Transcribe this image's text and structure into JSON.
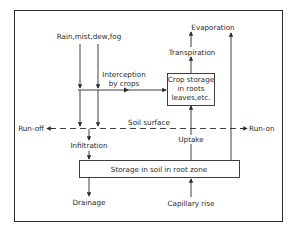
{
  "diagram": {
    "title": "",
    "labels": {
      "precipitation": "Rain,mist,dew,fog",
      "interception_line1": "Interception",
      "interception_line2": "by crops",
      "crop_storage_line1": "Crop storage",
      "crop_storage_line2": "in roots",
      "crop_storage_line3": "leaves,etc.",
      "transpiration": "Transpiration",
      "evaporation": "Evaporation",
      "soil_surface": "Soil surface",
      "run_off": "Run-off",
      "run_on": "Run-on",
      "infiltration": "Infiltration",
      "uptake": "Uptake",
      "soil_storage": "Storage in soil in root zone",
      "drainage": "Drainage",
      "capillary_rise": "Capillary rise"
    },
    "nodes": [
      {
        "id": "precipitation",
        "label": "Rain,mist,dew,fog",
        "type": "source"
      },
      {
        "id": "crop_storage",
        "label": "Crop storage in roots leaves,etc.",
        "type": "box"
      },
      {
        "id": "soil_storage",
        "label": "Storage in soil in root zone",
        "type": "box"
      },
      {
        "id": "transpiration",
        "label": "Transpiration",
        "type": "flow"
      },
      {
        "id": "evaporation",
        "label": "Evaporation",
        "type": "sink"
      },
      {
        "id": "run_off",
        "label": "Run-off",
        "type": "sink"
      },
      {
        "id": "run_on",
        "label": "Run-on",
        "type": "source"
      },
      {
        "id": "infiltration",
        "label": "Infiltration",
        "type": "flow"
      },
      {
        "id": "drainage",
        "label": "Drainage",
        "type": "sink"
      },
      {
        "id": "capillary_rise",
        "label": "Capillary rise",
        "type": "source"
      }
    ],
    "edges": [
      {
        "from": "precipitation",
        "to": "interception",
        "label": "Interception by crops"
      },
      {
        "from": "interception",
        "to": "crop_storage"
      },
      {
        "from": "crop_storage",
        "to": "transpiration"
      },
      {
        "from": "transpiration",
        "to": "evaporation"
      },
      {
        "from": "soil_storage",
        "to": "evaporation"
      },
      {
        "from": "precipitation",
        "to": "soil_surface"
      },
      {
        "from": "soil_surface",
        "to": "run_off"
      },
      {
        "from": "run_on",
        "to": "soil_surface"
      },
      {
        "from": "soil_surface",
        "to": "infiltration"
      },
      {
        "from": "infiltration",
        "to": "soil_storage"
      },
      {
        "from": "soil_storage",
        "to": "crop_storage",
        "label": "Uptake"
      },
      {
        "from": "soil_storage",
        "to": "drainage"
      },
      {
        "from": "capillary_rise",
        "to": "soil_storage"
      }
    ],
    "colors": {
      "line": "#2a2a2a",
      "background": "#ffffff"
    }
  }
}
